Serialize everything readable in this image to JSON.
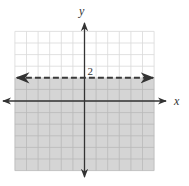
{
  "chart_data": {
    "type": "line",
    "title": "",
    "xlabel": "x",
    "ylabel": "y",
    "xlim": [
      -6,
      6
    ],
    "ylim": [
      -6,
      6
    ],
    "grid": true,
    "grid_step": 1,
    "legend": null,
    "tick_labels": [
      {
        "axis": "y",
        "value": 2,
        "label": "2"
      }
    ],
    "series": [
      {
        "name": "boundary y = 2",
        "style": "dashed",
        "arrows": "both",
        "x": [
          -6,
          6
        ],
        "y": [
          2,
          2
        ]
      }
    ],
    "shaded_region": {
      "inequality": "y < 2",
      "x_range": [
        -6,
        6
      ],
      "y_range": [
        -6,
        2
      ],
      "boundary_included": false
    },
    "colors": {
      "shade": "#d5d5d5",
      "grid_unshaded": "#d9d9d9",
      "grid_shaded": "#b9b9b9",
      "axis": "#333333",
      "boundary": "#3a3a3a"
    }
  },
  "labels": {
    "x_axis": "x",
    "y_axis": "y",
    "boundary_value": "2"
  }
}
